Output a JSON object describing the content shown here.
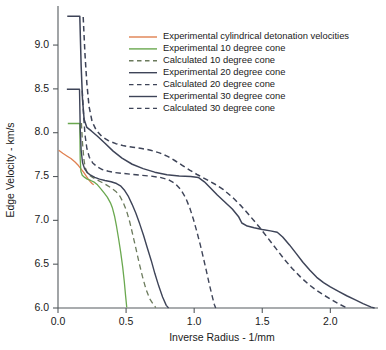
{
  "chart_data": {
    "type": "line",
    "title": "",
    "xlabel": "Inverse Radius - 1/mm",
    "ylabel": "Edge Velocity - km/s",
    "xlim": [
      0.0,
      2.35
    ],
    "ylim": [
      6.0,
      9.4
    ],
    "xticks": [
      0.0,
      0.5,
      1.0,
      1.5,
      2.0
    ],
    "xticklabels": [
      "0.0",
      "0.5",
      "1.0",
      "1.5",
      "2.0"
    ],
    "yticks": [
      6.0,
      6.5,
      7.0,
      7.5,
      8.0,
      8.5,
      9.0
    ],
    "yticklabels": [
      "6.0",
      "6.5",
      "7.0",
      "7.5",
      "8.0",
      "8.5",
      "9.0"
    ],
    "grid": false,
    "legend_position": "upper-center-right",
    "series": [
      {
        "name": "Experimental cylindrical detonation velocities",
        "style": "solid",
        "color": "#e08050",
        "width": 1.3,
        "points": [
          [
            0.005,
            7.8
          ],
          [
            0.035,
            7.765
          ],
          [
            0.065,
            7.735
          ],
          [
            0.095,
            7.705
          ],
          [
            0.125,
            7.665
          ],
          [
            0.15,
            7.625
          ],
          [
            0.17,
            7.585
          ],
          [
            0.19,
            7.545
          ],
          [
            0.205,
            7.51
          ],
          [
            0.22,
            7.475
          ],
          [
            0.235,
            7.445
          ],
          [
            0.25,
            7.42
          ],
          [
            0.262,
            7.405
          ]
        ]
      },
      {
        "name": "Experimental 10 degree cone",
        "style": "solid",
        "color": "#6aa84f",
        "width": 1.3,
        "points": [
          [
            0.072,
            8.105
          ],
          [
            0.16,
            8.105
          ],
          [
            0.163,
            7.7
          ],
          [
            0.168,
            7.56
          ],
          [
            0.178,
            7.515
          ],
          [
            0.196,
            7.49
          ],
          [
            0.215,
            7.47
          ],
          [
            0.24,
            7.455
          ],
          [
            0.262,
            7.44
          ],
          [
            0.29,
            7.405
          ],
          [
            0.315,
            7.36
          ],
          [
            0.34,
            7.31
          ],
          [
            0.362,
            7.265
          ],
          [
            0.385,
            7.2
          ],
          [
            0.4,
            7.14
          ],
          [
            0.415,
            7.05
          ],
          [
            0.43,
            6.93
          ],
          [
            0.445,
            6.79
          ],
          [
            0.46,
            6.64
          ],
          [
            0.475,
            6.47
          ],
          [
            0.487,
            6.3
          ],
          [
            0.497,
            6.13
          ],
          [
            0.505,
            6.005
          ]
        ]
      },
      {
        "name": "Calculated 10 degree cone",
        "style": "dashed",
        "color": "#6b7a5c",
        "width": 1.3,
        "points": [
          [
            0.172,
            8.11
          ],
          [
            0.18,
            7.88
          ],
          [
            0.19,
            7.7
          ],
          [
            0.2,
            7.6
          ],
          [
            0.215,
            7.545
          ],
          [
            0.235,
            7.51
          ],
          [
            0.26,
            7.485
          ],
          [
            0.29,
            7.46
          ],
          [
            0.32,
            7.435
          ],
          [
            0.355,
            7.405
          ],
          [
            0.39,
            7.37
          ],
          [
            0.425,
            7.33
          ],
          [
            0.455,
            7.275
          ],
          [
            0.48,
            7.2
          ],
          [
            0.505,
            7.1
          ],
          [
            0.528,
            6.975
          ],
          [
            0.55,
            6.83
          ],
          [
            0.572,
            6.68
          ],
          [
            0.595,
            6.52
          ],
          [
            0.62,
            6.36
          ],
          [
            0.645,
            6.22
          ],
          [
            0.672,
            6.11
          ],
          [
            0.7,
            6.04
          ],
          [
            0.718,
            6.005
          ]
        ]
      },
      {
        "name": "Experimental 20 degree cone",
        "style": "solid",
        "color": "#3e4458",
        "width": 1.4,
        "points": [
          [
            0.065,
            8.495
          ],
          [
            0.158,
            8.495
          ],
          [
            0.163,
            8.06
          ],
          [
            0.17,
            7.8
          ],
          [
            0.18,
            7.66
          ],
          [
            0.195,
            7.59
          ],
          [
            0.215,
            7.545
          ],
          [
            0.24,
            7.515
          ],
          [
            0.27,
            7.49
          ],
          [
            0.305,
            7.47
          ],
          [
            0.345,
            7.455
          ],
          [
            0.39,
            7.44
          ],
          [
            0.43,
            7.42
          ],
          [
            0.462,
            7.39
          ],
          [
            0.49,
            7.34
          ],
          [
            0.518,
            7.27
          ],
          [
            0.545,
            7.18
          ],
          [
            0.572,
            7.08
          ],
          [
            0.6,
            6.96
          ],
          [
            0.628,
            6.83
          ],
          [
            0.655,
            6.69
          ],
          [
            0.685,
            6.54
          ],
          [
            0.712,
            6.39
          ],
          [
            0.74,
            6.25
          ],
          [
            0.768,
            6.125
          ],
          [
            0.795,
            6.03
          ],
          [
            0.812,
            6.0
          ]
        ]
      },
      {
        "name": "Calculated 20 degree cone",
        "style": "dashed",
        "color": "#3e4458",
        "width": 1.4,
        "points": [
          [
            0.178,
            8.48
          ],
          [
            0.188,
            8.2
          ],
          [
            0.198,
            7.98
          ],
          [
            0.212,
            7.82
          ],
          [
            0.23,
            7.72
          ],
          [
            0.255,
            7.655
          ],
          [
            0.288,
            7.61
          ],
          [
            0.325,
            7.58
          ],
          [
            0.37,
            7.56
          ],
          [
            0.42,
            7.545
          ],
          [
            0.48,
            7.535
          ],
          [
            0.545,
            7.525
          ],
          [
            0.61,
            7.515
          ],
          [
            0.68,
            7.505
          ],
          [
            0.75,
            7.49
          ],
          [
            0.81,
            7.465
          ],
          [
            0.86,
            7.42
          ],
          [
            0.902,
            7.35
          ],
          [
            0.938,
            7.255
          ],
          [
            0.968,
            7.14
          ],
          [
            0.995,
            7.01
          ],
          [
            1.02,
            6.87
          ],
          [
            1.045,
            6.72
          ],
          [
            1.068,
            6.57
          ],
          [
            1.09,
            6.42
          ],
          [
            1.11,
            6.28
          ],
          [
            1.13,
            6.15
          ],
          [
            1.148,
            6.04
          ],
          [
            1.158,
            6.0
          ]
        ]
      },
      {
        "name": "Experimental 30 degree cone",
        "style": "solid",
        "color": "#3e4458",
        "width": 1.5,
        "points": [
          [
            0.068,
            9.33
          ],
          [
            0.16,
            9.33
          ],
          [
            0.17,
            8.76
          ],
          [
            0.18,
            8.38
          ],
          [
            0.192,
            8.15
          ],
          [
            0.212,
            8.06
          ],
          [
            0.245,
            8.02
          ],
          [
            0.29,
            7.96
          ],
          [
            0.345,
            7.88
          ],
          [
            0.405,
            7.79
          ],
          [
            0.47,
            7.71
          ],
          [
            0.545,
            7.64
          ],
          [
            0.625,
            7.59
          ],
          [
            0.71,
            7.55
          ],
          [
            0.8,
            7.52
          ],
          [
            0.89,
            7.505
          ],
          [
            0.975,
            7.5
          ],
          [
            1.03,
            7.49
          ],
          [
            1.075,
            7.44
          ],
          [
            1.12,
            7.37
          ],
          [
            1.17,
            7.29
          ],
          [
            1.225,
            7.21
          ],
          [
            1.28,
            7.13
          ],
          [
            1.325,
            7.045
          ],
          [
            1.35,
            6.97
          ],
          [
            1.39,
            6.935
          ],
          [
            1.44,
            6.915
          ],
          [
            1.5,
            6.895
          ],
          [
            1.56,
            6.88
          ],
          [
            1.61,
            6.865
          ],
          [
            1.65,
            6.81
          ],
          [
            1.7,
            6.72
          ],
          [
            1.75,
            6.62
          ],
          [
            1.8,
            6.52
          ],
          [
            1.85,
            6.43
          ],
          [
            1.9,
            6.35
          ],
          [
            1.95,
            6.29
          ],
          [
            2.0,
            6.24
          ],
          [
            2.06,
            6.19
          ],
          [
            2.12,
            6.14
          ],
          [
            2.18,
            6.095
          ],
          [
            2.24,
            6.05
          ],
          [
            2.3,
            6.01
          ],
          [
            2.325,
            6.0
          ]
        ]
      },
      {
        "name": "Calculated 30 degree cone",
        "style": "dashed",
        "color": "#3e4458",
        "width": 1.5,
        "points": [
          [
            0.185,
            9.32
          ],
          [
            0.198,
            8.9
          ],
          [
            0.212,
            8.56
          ],
          [
            0.228,
            8.3
          ],
          [
            0.25,
            8.13
          ],
          [
            0.28,
            8.03
          ],
          [
            0.32,
            7.96
          ],
          [
            0.37,
            7.91
          ],
          [
            0.425,
            7.875
          ],
          [
            0.485,
            7.85
          ],
          [
            0.55,
            7.835
          ],
          [
            0.615,
            7.82
          ],
          [
            0.68,
            7.8
          ],
          [
            0.745,
            7.77
          ],
          [
            0.805,
            7.73
          ],
          [
            0.86,
            7.68
          ],
          [
            0.915,
            7.625
          ],
          [
            0.97,
            7.57
          ],
          [
            1.025,
            7.52
          ],
          [
            1.085,
            7.47
          ],
          [
            1.15,
            7.415
          ],
          [
            1.215,
            7.35
          ],
          [
            1.28,
            7.265
          ],
          [
            1.345,
            7.165
          ],
          [
            1.41,
            7.05
          ],
          [
            1.475,
            6.93
          ],
          [
            1.54,
            6.8
          ],
          [
            1.6,
            6.68
          ],
          [
            1.66,
            6.56
          ],
          [
            1.72,
            6.45
          ],
          [
            1.78,
            6.355
          ],
          [
            1.84,
            6.27
          ],
          [
            1.9,
            6.2
          ],
          [
            1.96,
            6.14
          ],
          [
            2.02,
            6.085
          ],
          [
            2.07,
            6.04
          ],
          [
            2.11,
            6.01
          ],
          [
            2.13,
            6.0
          ]
        ]
      }
    ],
    "legend": [
      {
        "label": "Experimental cylindrical detonation velocities",
        "color": "#e08050",
        "style": "solid"
      },
      {
        "label": "Experimental 10 degree cone",
        "color": "#6aa84f",
        "style": "solid"
      },
      {
        "label": "Calculated 10 degree cone",
        "color": "#6b7a5c",
        "style": "dashed"
      },
      {
        "label": "Experimental 20 degree cone",
        "color": "#3e4458",
        "style": "solid"
      },
      {
        "label": "Calculated 20 degree cone",
        "color": "#3e4458",
        "style": "dashed"
      },
      {
        "label": "Experimental 30 degree cone",
        "color": "#3e4458",
        "style": "solid"
      },
      {
        "label": "Calculated 30 degree cone",
        "color": "#3e4458",
        "style": "dashed"
      }
    ]
  }
}
